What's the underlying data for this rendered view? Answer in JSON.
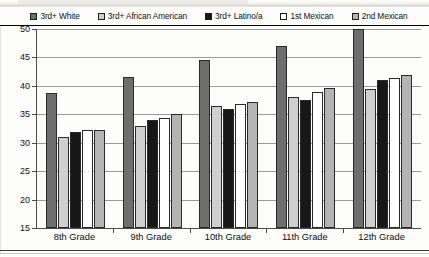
{
  "chart_data": {
    "type": "bar",
    "title": "",
    "subtitle": "",
    "xlabel": "",
    "ylabel": "",
    "ylim": [
      15,
      50
    ],
    "ytick_step": 5,
    "yticks": [
      50,
      45,
      40,
      35,
      30,
      25,
      20,
      15
    ],
    "grid": true,
    "legend_position": "top",
    "categories": [
      "8th Grade",
      "9th Grade",
      "10th Grade",
      "11th Grade",
      "12th Grade"
    ],
    "series": [
      {
        "name": "3rd+ White",
        "swatch_color": "#6e6e6e",
        "values": [
          38.7,
          41.5,
          44.5,
          47.0,
          50.0
        ]
      },
      {
        "name": "3rd+ African American",
        "swatch_color": "#cfcfcf",
        "values": [
          31.0,
          33.0,
          36.5,
          38.0,
          39.4
        ]
      },
      {
        "name": "3rd+ Latino/a",
        "swatch_color": "#171717",
        "values": [
          31.8,
          34.0,
          36.0,
          37.5,
          41.0
        ]
      },
      {
        "name": "1st Mexican",
        "swatch_color": "#ffffff",
        "values": [
          32.2,
          34.3,
          36.8,
          39.0,
          41.3
        ]
      },
      {
        "name": "2nd Mexican",
        "swatch_color": "#b4b4b4",
        "values": [
          32.3,
          35.0,
          37.2,
          39.6,
          42.0
        ]
      }
    ]
  },
  "legend": {
    "items": [
      {
        "label": "3rd+ White"
      },
      {
        "label": "3rd+ African American"
      },
      {
        "label": "3rd+ Latino/a"
      },
      {
        "label": "1st Mexican"
      },
      {
        "label": "2nd Mexican"
      }
    ]
  },
  "axis": {
    "y_labels": [
      "50",
      "45",
      "40",
      "35",
      "30",
      "25",
      "20",
      "15"
    ],
    "x_labels": [
      "8th Grade",
      "9th Grade",
      "10th Grade",
      "11th Grade",
      "12th Grade"
    ]
  }
}
